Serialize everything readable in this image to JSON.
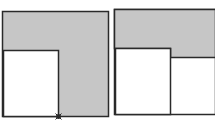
{
  "diagram": {
    "colors": {
      "shade": "#c6c6c6",
      "stroke": "#2a2a2a",
      "blank": "#ffffff"
    },
    "panels": [
      {
        "name": "left-panel",
        "outer": {
          "x": 2.5,
          "y": 11.5,
          "w": 106,
          "h": 105
        },
        "inner_square": {
          "x": 3.5,
          "y": 50.5,
          "w": 55,
          "h": 66
        },
        "marker": {
          "x": 58.5,
          "y": 116.5
        }
      },
      {
        "name": "right-panel",
        "outer": {
          "x": 114.5,
          "y": 9.5,
          "w": 101,
          "h": 105
        },
        "shaded_band_bottom": 57.5,
        "inner_square": {
          "x": 115.5,
          "y": 48.5,
          "w": 55,
          "h": 66
        }
      }
    ]
  }
}
